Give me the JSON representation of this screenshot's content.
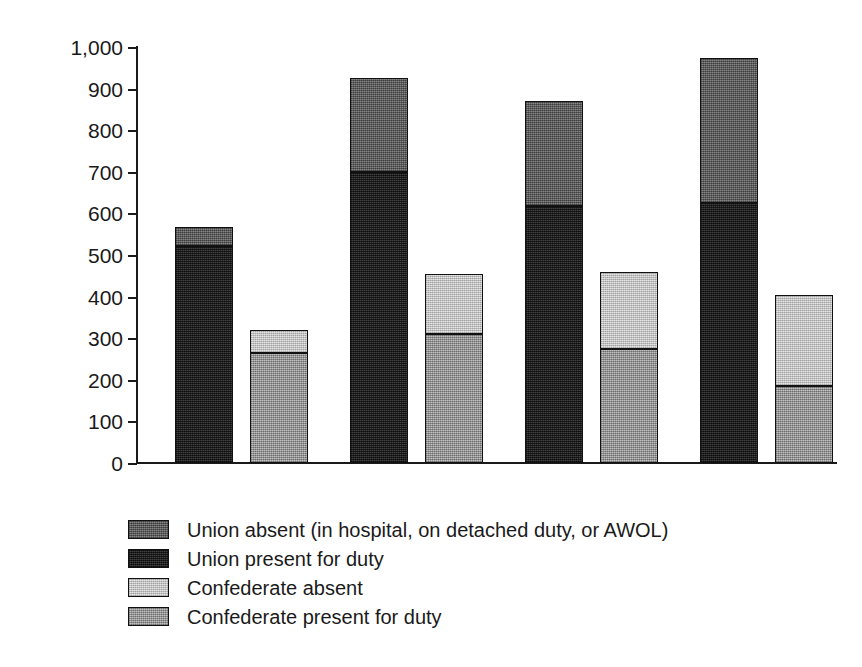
{
  "chart_data": {
    "type": "bar",
    "title": "",
    "subtitle": "",
    "xlabel": "",
    "ylabel": "Thousands",
    "ylim": [
      0,
      1000
    ],
    "yticks": [
      "0",
      "100",
      "200",
      "300",
      "400",
      "500",
      "600",
      "700",
      "800",
      "900",
      "1,000"
    ],
    "ytick_values": [
      0,
      100,
      200,
      300,
      400,
      500,
      600,
      700,
      800,
      900,
      1000
    ],
    "grid": false,
    "stacked": true,
    "legend_position": "bottom-left",
    "categories": [
      "January 1, 1862",
      "January 1, 1863",
      "January 1, 1864",
      "January 1, 1865"
    ],
    "series": [
      {
        "name": "Union present for duty",
        "key": "union_present",
        "color": "#262626",
        "group": "Union",
        "values": [
          521,
          700,
          618,
          625
        ]
      },
      {
        "name": "Union absent (in hospital, on detached duty, or AWOL)",
        "key": "union_absent",
        "color": "#6e6e6e",
        "group": "Union",
        "values": [
          46,
          226,
          252,
          348
        ]
      },
      {
        "name": "Confederate present for duty",
        "key": "confederate_present",
        "color": "#a2a2a2",
        "group": "Confederate",
        "values": [
          264,
          310,
          274,
          185
        ]
      },
      {
        "name": "Confederate absent",
        "key": "confederate_absent",
        "color": "#cfcfcf",
        "group": "Confederate",
        "values": [
          56,
          144,
          185,
          219
        ]
      }
    ],
    "totals": {
      "union": [
        567,
        926,
        870,
        973
      ],
      "confederate": [
        320,
        454,
        459,
        404
      ]
    }
  },
  "axis": {
    "y_label": "Thousands",
    "ticks": [
      {
        "label": "1,000",
        "value": 1000
      },
      {
        "label": "900",
        "value": 900
      },
      {
        "label": "800",
        "value": 800
      },
      {
        "label": "700",
        "value": 700
      },
      {
        "label": "600",
        "value": 600
      },
      {
        "label": "500",
        "value": 500
      },
      {
        "label": "400",
        "value": 400
      },
      {
        "label": "300",
        "value": 300
      },
      {
        "label": "200",
        "value": 200
      },
      {
        "label": "100",
        "value": 100
      },
      {
        "label": "0",
        "value": 0
      }
    ]
  },
  "categories": [
    {
      "label": "January 1, 1862"
    },
    {
      "label": "January 1, 1863"
    },
    {
      "label": "January 1, 1864"
    },
    {
      "label": "January 1, 1865"
    }
  ],
  "legend": {
    "items": [
      {
        "label": "Union absent (in hospital, on detached duty, or AWOL)",
        "swatch": "union-absent",
        "color": "#6e6e6e"
      },
      {
        "label": "Union present for duty",
        "swatch": "union-present",
        "color": "#262626"
      },
      {
        "label": "Confederate absent",
        "swatch": "confederate-absent",
        "color": "#cfcfcf"
      },
      {
        "label": "Confederate present for duty",
        "swatch": "confederate-present",
        "color": "#a2a2a2"
      }
    ]
  }
}
